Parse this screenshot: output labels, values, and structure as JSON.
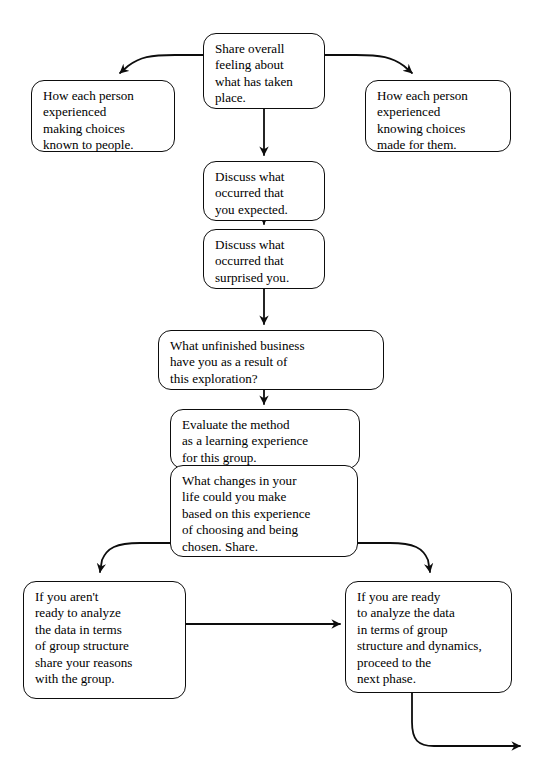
{
  "document": {
    "title_partial": "",
    "type": "flowchart",
    "background_color": "#ffffff",
    "line_color": "#0d0d0d"
  },
  "nodes": {
    "share_overall": {
      "label": "Share overall\nfeeling about\nwhat has taken\nplace.",
      "x": 203,
      "y": 33,
      "w": 122,
      "h": 76
    },
    "left_making_choices": {
      "label": "How each person\nexperienced\nmaking choices\nknown to people.",
      "x": 31,
      "y": 80,
      "w": 144,
      "h": 72
    },
    "right_knowing_choices": {
      "label": "How each person\nexperienced\nknowing choices\nmade for them.",
      "x": 365,
      "y": 80,
      "w": 146,
      "h": 72
    },
    "discuss_expected": {
      "label": "Discuss what\noccurred that\nyou expected.",
      "x": 203,
      "y": 161,
      "w": 122,
      "h": 60
    },
    "discuss_surprised": {
      "label": "Discuss what\noccurred that\nsurprised you.",
      "x": 203,
      "y": 229,
      "w": 122,
      "h": 60
    },
    "unfinished_business": {
      "label": "What unfinished business\nhave you as a result of\nthis exploration?",
      "x": 158,
      "y": 330,
      "w": 226,
      "h": 60
    },
    "evaluate_method": {
      "label": "Evaluate the method\nas a learning experience\nfor this group.",
      "x": 170,
      "y": 409,
      "w": 190,
      "h": 60
    },
    "what_changes": {
      "label": "What changes in your\nlife could you make\nbased on this experience\nof choosing and being\nchosen. Share.",
      "x": 170,
      "y": 465,
      "w": 188,
      "h": 92
    },
    "not_ready": {
      "label": "If you aren't\nready to analyze\nthe data in terms\nof group structure\nshare your reasons\nwith the group.",
      "x": 23,
      "y": 581,
      "w": 163,
      "h": 118
    },
    "are_ready": {
      "label": "If you are ready\nto analyze the data\nin terms of group\nstructure and dynamics,\nproceed to the\nnext phase.",
      "x": 345,
      "y": 581,
      "w": 167,
      "h": 112
    }
  },
  "edges": [
    {
      "name": "share-to-left-making-choices",
      "kind": "curved-arrow"
    },
    {
      "name": "share-to-right-knowing-choices",
      "kind": "curved-arrow"
    },
    {
      "name": "share-to-discuss-expected",
      "kind": "straight-arrow"
    },
    {
      "name": "discuss-expected-to-discuss-surprised",
      "kind": "straight-arrow"
    },
    {
      "name": "discuss-surprised-to-unfinished-business",
      "kind": "straight-arrow"
    },
    {
      "name": "unfinished-business-to-evaluate-method",
      "kind": "straight-arrow"
    },
    {
      "name": "evaluate-method-to-what-changes",
      "kind": "straight-arrow"
    },
    {
      "name": "what-changes-to-not-ready",
      "kind": "curved-arrow"
    },
    {
      "name": "what-changes-to-are-ready",
      "kind": "curved-arrow"
    },
    {
      "name": "not-ready-to-are-ready",
      "kind": "straight-arrow"
    },
    {
      "name": "are-ready-to-next-phase-exit",
      "kind": "curved-arrow"
    }
  ]
}
